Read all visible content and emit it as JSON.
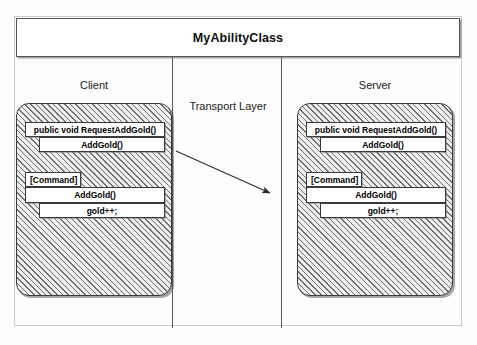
{
  "diagram": {
    "title": "MyAbilityClass",
    "lanes": {
      "client_label": "Client",
      "transport_label": "Transport Layer",
      "server_label": "Server"
    },
    "colors": {
      "stroke": "#3a3a3a",
      "hatch": "#6f6f6f",
      "panel_fill": "#efefef",
      "box_fill": "#ffffff",
      "text": "#000000"
    },
    "client": {
      "method_request": "public void RequestAddGold()",
      "method_request_body": "AddGold()",
      "attribute_tag": "[Command]",
      "method_command": "AddGold()",
      "method_command_body": "gold++;"
    },
    "server": {
      "method_request": "public void RequestAddGold()",
      "method_request_body": "AddGold()",
      "attribute_tag": "[Command]",
      "method_command": "AddGold()",
      "method_command_body": "gold++;"
    },
    "arrow": {
      "name": "transport-arrow",
      "from": "client",
      "to": "server"
    }
  }
}
